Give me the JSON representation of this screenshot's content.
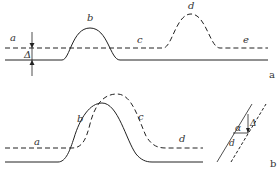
{
  "diagram": {
    "panel_a": {
      "panel_label": "a",
      "labels": {
        "a": "a",
        "b": "b",
        "c": "c",
        "d": "d",
        "e": "e",
        "delta": "Δ"
      }
    },
    "panel_b": {
      "panel_label": "b",
      "labels": {
        "a": "a",
        "b": "b",
        "c": "c",
        "d": "d"
      },
      "inset": {
        "alpha": "α",
        "delta": "Δ",
        "d": "d"
      }
    },
    "colors": {
      "line": "#222222",
      "text": "#333333",
      "background": "#ffffff"
    }
  }
}
